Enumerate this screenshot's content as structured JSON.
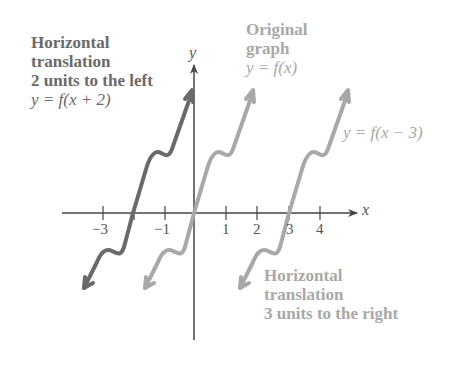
{
  "diagram": {
    "left_label": {
      "lines": [
        "Horizontal",
        "translation",
        "2 units to the left"
      ],
      "equation": "y = f(x + 2)"
    },
    "top_label": {
      "lines": [
        "Original",
        "graph"
      ],
      "equation": "y = f(x)"
    },
    "right_label": {
      "equation": "y = f(x − 3)"
    },
    "bottom_label": {
      "lines": [
        "Horizontal",
        "translation",
        "3 units to the right"
      ]
    },
    "axes": {
      "x_label": "x",
      "y_label": "y",
      "x_ticks": [
        "−3",
        "−1",
        "1",
        "2",
        "3",
        "4"
      ]
    },
    "colors": {
      "shifted_left_curve": "#6a6a6a",
      "original_curve": "#a8a8a8",
      "shifted_right_curve": "#a8a8a8",
      "axes": "#444444"
    }
  }
}
